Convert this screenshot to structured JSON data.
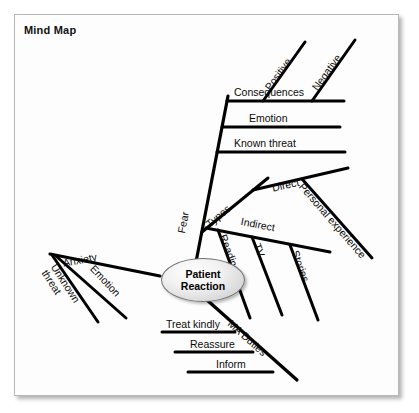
{
  "diagram": {
    "title": "Mind Map",
    "type": "mind-map",
    "center": {
      "label": "Patient Reaction",
      "line1": "Patient",
      "line2": "Reaction"
    },
    "colors": {
      "page_background": "#ffffff",
      "frame_background": "#fdfdfd",
      "frame_border": "#b7b7b7",
      "branch_stroke": "#000000",
      "text": "#0b0b0b",
      "node_fill": "#e8e8e8",
      "node_border": "#6f6f6f"
    },
    "branches": [
      {
        "label": "Fear",
        "children": [
          {
            "label": "Known threat",
            "children": [
              {
                "label": "Emotion",
                "children": [
                  {
                    "label": "Consequences",
                    "children": [
                      {
                        "label": "Positive",
                        "children": []
                      },
                      {
                        "label": "Negative",
                        "children": []
                      }
                    ]
                  }
                ]
              }
            ]
          },
          {
            "label": "Types",
            "children": [
              {
                "label": "Direct",
                "children": [
                  {
                    "label": "Personal experience",
                    "children": []
                  }
                ]
              },
              {
                "label": "Indirect",
                "children": [
                  {
                    "label": "Reading",
                    "children": []
                  },
                  {
                    "label": "TV",
                    "children": []
                  },
                  {
                    "label": "Stories",
                    "children": []
                  }
                ]
              }
            ]
          }
        ]
      },
      {
        "label": "Anxiety",
        "children": [
          {
            "label": "Unknown threat",
            "children": []
          },
          {
            "label": "Emotion",
            "children": []
          }
        ]
      },
      {
        "label": "MA Duties",
        "children": [
          {
            "label": "Treat kindly",
            "children": []
          },
          {
            "label": "Reassure",
            "children": []
          },
          {
            "label": "Inform",
            "children": []
          }
        ]
      }
    ],
    "labels": {
      "fear": "Fear",
      "known_threat": "Known threat",
      "emotion_top": "Emotion",
      "consequences": "Consequences",
      "positive": "Positive",
      "negative": "Negative",
      "types": "Types",
      "direct": "Direct",
      "personal_experience": "Personal experience",
      "indirect": "Indirect",
      "reading": "Reading",
      "tv": "TV",
      "stories": "Stories",
      "anxiety": "Anxiety",
      "unknown_threat": "Unknown threat",
      "emotion_left": "Emotion",
      "ma_duties": "MA Duties",
      "treat_kindly": "Treat kindly",
      "reassure": "Reassure",
      "inform": "Inform"
    }
  }
}
